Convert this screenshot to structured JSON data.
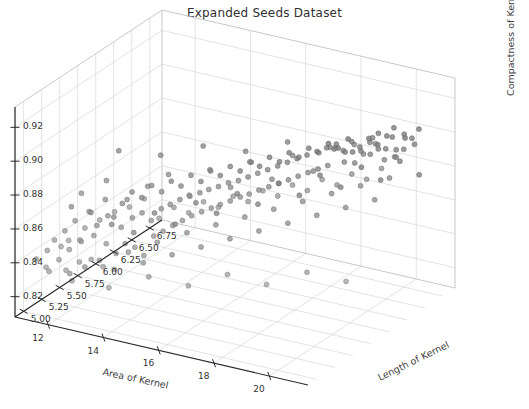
{
  "figure": {
    "title": "Expanded Seeds Dataset",
    "background": "#ffffff",
    "width": 529,
    "height": 409
  },
  "chart_data": {
    "type": "scatter",
    "projection": "3d",
    "title": "Expanded Seeds Dataset",
    "xlabel": "Area of Kernel",
    "ylabel": "Length of Kernel",
    "zlabel": "Compactness of Kernel",
    "xticks": [
      12,
      14,
      16,
      18,
      20
    ],
    "yticks": [
      5.0,
      5.25,
      5.5,
      5.75,
      6.0,
      6.25,
      6.5,
      6.75
    ],
    "zticks": [
      0.82,
      0.84,
      0.86,
      0.88,
      0.9,
      0.92
    ],
    "xtick_labels": [
      "12",
      "14",
      "16",
      "18",
      "20"
    ],
    "ytick_labels": [
      "5.00",
      "5.25",
      "5.50",
      "5.75",
      "6.00",
      "6.25",
      "6.50",
      "6.75"
    ],
    "ztick_labels": [
      "0.82",
      "0.84",
      "0.86",
      "0.88",
      "0.90",
      "0.92"
    ],
    "xlim": [
      10.8,
      21.4
    ],
    "ylim": [
      4.88,
      6.92
    ],
    "zlim": [
      0.808,
      0.932
    ],
    "grid": true,
    "legend": null,
    "marker": {
      "shape": "circle",
      "size": 5,
      "color": "#808080",
      "edge_color": "#6e6e6e",
      "alpha": 0.75
    },
    "n_points": 215,
    "points": [
      [
        11.23,
        5.01,
        0.8402
      ],
      [
        11.42,
        5.09,
        0.8437
      ],
      [
        11.55,
        5.14,
        0.849
      ],
      [
        11.61,
        5.18,
        0.8365
      ],
      [
        11.72,
        5.22,
        0.8528
      ],
      [
        11.8,
        5.25,
        0.8412
      ],
      [
        11.88,
        5.3,
        0.8571
      ],
      [
        11.95,
        5.34,
        0.8449
      ],
      [
        12.02,
        5.12,
        0.8335
      ],
      [
        12.1,
        5.41,
        0.8603
      ],
      [
        12.18,
        5.27,
        0.8468
      ],
      [
        12.25,
        5.46,
        0.8512
      ],
      [
        12.32,
        5.19,
        0.8376
      ],
      [
        12.4,
        5.52,
        0.8655
      ],
      [
        12.48,
        5.33,
        0.8498
      ],
      [
        12.55,
        5.58,
        0.854
      ],
      [
        12.62,
        5.24,
        0.8388
      ],
      [
        12.7,
        5.44,
        0.8592
      ],
      [
        12.78,
        5.61,
        0.862
      ],
      [
        12.85,
        5.36,
        0.8456
      ],
      [
        12.92,
        5.29,
        0.8342
      ],
      [
        13.0,
        5.66,
        0.8683
      ],
      [
        13.08,
        5.48,
        0.8528
      ],
      [
        13.15,
        5.38,
        0.8404
      ],
      [
        13.22,
        5.71,
        0.8644
      ],
      [
        13.3,
        5.55,
        0.8572
      ],
      [
        13.38,
        5.42,
        0.846
      ],
      [
        13.45,
        5.76,
        0.871
      ],
      [
        13.52,
        5.6,
        0.8596
      ],
      [
        13.6,
        5.47,
        0.8432
      ],
      [
        13.68,
        5.81,
        0.8668
      ],
      [
        13.75,
        5.64,
        0.8548
      ],
      [
        13.82,
        5.51,
        0.838
      ],
      [
        13.9,
        5.86,
        0.8724
      ],
      [
        13.98,
        5.69,
        0.8612
      ],
      [
        14.05,
        5.56,
        0.849
      ],
      [
        14.12,
        5.91,
        0.869
      ],
      [
        14.2,
        5.73,
        0.8634
      ],
      [
        14.28,
        5.6,
        0.8516
      ],
      [
        14.35,
        5.96,
        0.8748
      ],
      [
        14.42,
        5.78,
        0.8658
      ],
      [
        14.5,
        5.65,
        0.8544
      ],
      [
        14.58,
        6.01,
        0.8706
      ],
      [
        14.65,
        5.83,
        0.8672
      ],
      [
        14.72,
        5.7,
        0.8568
      ],
      [
        14.8,
        6.06,
        0.8762
      ],
      [
        14.88,
        5.88,
        0.8688
      ],
      [
        14.95,
        5.74,
        0.8594
      ],
      [
        15.02,
        6.11,
        0.873
      ],
      [
        15.1,
        5.92,
        0.8704
      ],
      [
        15.18,
        5.79,
        0.8612
      ],
      [
        15.25,
        6.16,
        0.8778
      ],
      [
        15.32,
        5.97,
        0.8716
      ],
      [
        15.4,
        5.84,
        0.8628
      ],
      [
        15.48,
        6.21,
        0.8746
      ],
      [
        15.55,
        6.02,
        0.8732
      ],
      [
        15.62,
        5.88,
        0.8646
      ],
      [
        15.7,
        6.26,
        0.8794
      ],
      [
        15.78,
        6.07,
        0.874
      ],
      [
        15.85,
        5.93,
        0.8662
      ],
      [
        15.92,
        6.31,
        0.8762
      ],
      [
        16.0,
        6.12,
        0.8756
      ],
      [
        16.08,
        5.98,
        0.868
      ],
      [
        16.15,
        6.36,
        0.881
      ],
      [
        16.22,
        6.17,
        0.8772
      ],
      [
        16.3,
        6.02,
        0.8694
      ],
      [
        16.38,
        6.41,
        0.8778
      ],
      [
        16.45,
        6.22,
        0.8788
      ],
      [
        16.52,
        6.07,
        0.8712
      ],
      [
        16.6,
        6.46,
        0.8826
      ],
      [
        16.68,
        6.27,
        0.8804
      ],
      [
        16.75,
        6.12,
        0.8726
      ],
      [
        16.82,
        6.51,
        0.8794
      ],
      [
        16.9,
        6.32,
        0.882
      ],
      [
        16.98,
        6.17,
        0.8742
      ],
      [
        17.05,
        6.56,
        0.8842
      ],
      [
        17.12,
        6.37,
        0.8836
      ],
      [
        17.2,
        6.22,
        0.8756
      ],
      [
        17.28,
        6.61,
        0.881
      ],
      [
        17.35,
        6.42,
        0.8852
      ],
      [
        17.42,
        6.27,
        0.8772
      ],
      [
        17.5,
        6.66,
        0.8858
      ],
      [
        17.58,
        6.47,
        0.8868
      ],
      [
        17.65,
        6.32,
        0.8788
      ],
      [
        17.72,
        6.71,
        0.8826
      ],
      [
        17.8,
        6.52,
        0.8884
      ],
      [
        17.88,
        6.37,
        0.8804
      ],
      [
        17.95,
        6.76,
        0.8874
      ],
      [
        18.02,
        6.57,
        0.89
      ],
      [
        18.1,
        6.42,
        0.8818
      ],
      [
        18.18,
        6.63,
        0.8842
      ],
      [
        18.25,
        6.47,
        0.8916
      ],
      [
        18.32,
        6.68,
        0.8834
      ],
      [
        18.4,
        6.52,
        0.889
      ],
      [
        18.48,
        6.72,
        0.8858
      ],
      [
        18.55,
        6.58,
        0.8932
      ],
      [
        18.62,
        6.45,
        0.885
      ],
      [
        18.7,
        6.76,
        0.8906
      ],
      [
        18.78,
        6.62,
        0.8874
      ],
      [
        18.85,
        6.5,
        0.8948
      ],
      [
        18.92,
        6.8,
        0.8866
      ],
      [
        19.0,
        6.66,
        0.8922
      ],
      [
        19.08,
        6.54,
        0.889
      ],
      [
        19.15,
        6.72,
        0.8964
      ],
      [
        19.22,
        6.58,
        0.8882
      ],
      [
        19.3,
        6.78,
        0.8938
      ],
      [
        19.38,
        6.63,
        0.8906
      ],
      [
        19.45,
        6.82,
        0.898
      ],
      [
        19.52,
        6.68,
        0.8898
      ],
      [
        19.6,
        6.74,
        0.8954
      ],
      [
        19.68,
        6.6,
        0.8862
      ],
      [
        19.75,
        6.86,
        0.892
      ],
      [
        19.82,
        6.71,
        0.8896
      ],
      [
        19.9,
        6.79,
        0.8968
      ],
      [
        19.98,
        6.65,
        0.8874
      ],
      [
        20.05,
        6.84,
        0.8936
      ],
      [
        20.12,
        6.7,
        0.8912
      ],
      [
        20.2,
        6.88,
        0.8984
      ],
      [
        11.3,
        5.16,
        0.829
      ],
      [
        11.48,
        5.05,
        0.8352
      ],
      [
        11.66,
        5.31,
        0.8248
      ],
      [
        11.84,
        5.12,
        0.8468
      ],
      [
        12.05,
        5.37,
        0.8285
      ],
      [
        12.22,
        5.08,
        0.853
      ],
      [
        12.42,
        5.43,
        0.8322
      ],
      [
        12.6,
        5.16,
        0.8595
      ],
      [
        12.8,
        5.49,
        0.8265
      ],
      [
        12.98,
        5.22,
        0.864
      ],
      [
        13.18,
        5.54,
        0.8368
      ],
      [
        13.36,
        5.28,
        0.8686
      ],
      [
        13.56,
        5.6,
        0.8302
      ],
      [
        13.74,
        5.34,
        0.8712
      ],
      [
        13.94,
        5.65,
        0.8424
      ],
      [
        14.12,
        5.4,
        0.8758
      ],
      [
        14.32,
        5.71,
        0.8348
      ],
      [
        14.5,
        5.46,
        0.864
      ],
      [
        14.7,
        5.77,
        0.8476
      ],
      [
        14.88,
        5.52,
        0.8702
      ],
      [
        15.08,
        5.82,
        0.8392
      ],
      [
        15.26,
        5.58,
        0.8668
      ],
      [
        15.46,
        5.88,
        0.852
      ],
      [
        15.64,
        5.64,
        0.873
      ],
      [
        15.84,
        5.93,
        0.8438
      ],
      [
        16.02,
        5.7,
        0.8696
      ],
      [
        16.22,
        5.99,
        0.8564
      ],
      [
        16.4,
        5.76,
        0.8758
      ],
      [
        16.6,
        6.04,
        0.8482
      ],
      [
        16.78,
        5.82,
        0.8724
      ],
      [
        16.98,
        6.1,
        0.8608
      ],
      [
        17.16,
        5.88,
        0.8786
      ],
      [
        17.36,
        6.15,
        0.8526
      ],
      [
        17.54,
        5.94,
        0.8752
      ],
      [
        17.74,
        6.21,
        0.8652
      ],
      [
        17.92,
        6.0,
        0.8814
      ],
      [
        18.12,
        6.26,
        0.857
      ],
      [
        18.3,
        6.06,
        0.878
      ],
      [
        18.5,
        6.32,
        0.8696
      ],
      [
        18.68,
        6.12,
        0.8842
      ],
      [
        18.88,
        6.37,
        0.8614
      ],
      [
        19.06,
        6.18,
        0.8808
      ],
      [
        19.26,
        6.43,
        0.874
      ],
      [
        19.44,
        6.24,
        0.887
      ],
      [
        19.64,
        6.48,
        0.8658
      ],
      [
        19.82,
        6.3,
        0.8836
      ],
      [
        20.02,
        6.54,
        0.8784
      ],
      [
        20.2,
        6.36,
        0.8898
      ],
      [
        11.38,
        5.44,
        0.8596
      ],
      [
        11.62,
        5.62,
        0.852
      ],
      [
        11.9,
        5.38,
        0.8712
      ],
      [
        12.16,
        5.7,
        0.8448
      ],
      [
        12.44,
        5.52,
        0.8768
      ],
      [
        12.7,
        5.8,
        0.8392
      ],
      [
        12.98,
        5.6,
        0.8654
      ],
      [
        13.24,
        5.88,
        0.8506
      ],
      [
        13.52,
        5.68,
        0.873
      ],
      [
        13.78,
        5.96,
        0.8438
      ],
      [
        14.06,
        5.76,
        0.8798
      ],
      [
        14.32,
        6.04,
        0.8562
      ],
      [
        14.6,
        5.84,
        0.8674
      ],
      [
        14.86,
        6.12,
        0.8498
      ],
      [
        15.14,
        5.92,
        0.8822
      ],
      [
        15.4,
        6.2,
        0.8612
      ],
      [
        15.68,
        6.0,
        0.8716
      ],
      [
        15.94,
        6.28,
        0.8548
      ],
      [
        16.22,
        6.08,
        0.8862
      ],
      [
        16.48,
        6.36,
        0.8668
      ],
      [
        16.76,
        6.16,
        0.876
      ],
      [
        17.02,
        6.44,
        0.8596
      ],
      [
        17.3,
        6.24,
        0.8898
      ],
      [
        17.56,
        6.52,
        0.8712
      ],
      [
        17.84,
        6.32,
        0.8804
      ],
      [
        18.1,
        6.6,
        0.864
      ],
      [
        18.38,
        6.4,
        0.8932
      ],
      [
        18.64,
        6.68,
        0.8756
      ],
      [
        18.92,
        6.48,
        0.8848
      ],
      [
        19.18,
        6.74,
        0.8684
      ],
      [
        19.46,
        6.56,
        0.896
      ],
      [
        19.72,
        6.8,
        0.8798
      ],
      [
        20.0,
        6.62,
        0.8886
      ],
      [
        20.26,
        6.86,
        0.8722
      ],
      [
        12.08,
        5.18,
        0.8258
      ],
      [
        13.1,
        5.3,
        0.8222
      ],
      [
        14.18,
        5.44,
        0.8288
      ],
      [
        15.3,
        5.56,
        0.8244
      ],
      [
        16.4,
        5.68,
        0.8318
      ],
      [
        17.5,
        5.8,
        0.8268
      ],
      [
        18.6,
        5.94,
        0.8342
      ],
      [
        19.7,
        6.06,
        0.8296
      ],
      [
        12.52,
        5.66,
        0.8908
      ],
      [
        13.62,
        5.82,
        0.8878
      ],
      [
        14.74,
        5.98,
        0.893
      ],
      [
        15.86,
        6.14,
        0.8896
      ],
      [
        16.96,
        6.3,
        0.8948
      ],
      [
        18.08,
        6.46,
        0.8914
      ],
      [
        19.2,
        6.62,
        0.8968
      ],
      [
        20.3,
        6.78,
        0.8926
      ]
    ]
  },
  "axes_geometry": {
    "origin": {
      "x": 308,
      "y": 385
    },
    "x_end": {
      "x": 15,
      "y": 317
    },
    "y_end": {
      "x": 455,
      "y": 288
    },
    "z_top": {
      "x": 455,
      "y": 78
    }
  }
}
